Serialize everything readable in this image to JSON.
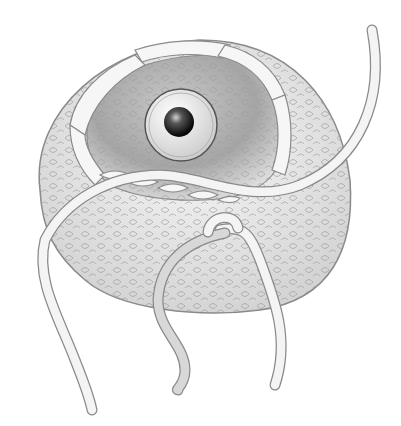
{
  "illustration": {
    "subject": "crocheted amigurumi piece with safety eye and yarn tails",
    "colors": {
      "background": "#ffffff",
      "outline": "#8a8a8a",
      "yarn_fill": "#f4f4f4",
      "inner_shade": "#9a9a9a",
      "eye_white": "#e8e8e8",
      "pupil": "#1a1a1a"
    }
  }
}
